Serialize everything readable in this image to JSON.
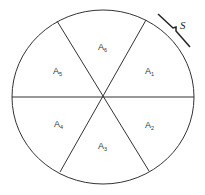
{
  "diagram": {
    "type": "circle divided into six equal sectors",
    "sectors": [
      {
        "label": "A",
        "sub": "1"
      },
      {
        "label": "A",
        "sub": "2"
      },
      {
        "label": "A",
        "sub": "3"
      },
      {
        "label": "A",
        "sub": "4"
      },
      {
        "label": "A",
        "sub": "5"
      },
      {
        "label": "A",
        "sub": "6"
      }
    ],
    "arc_label": "S"
  }
}
